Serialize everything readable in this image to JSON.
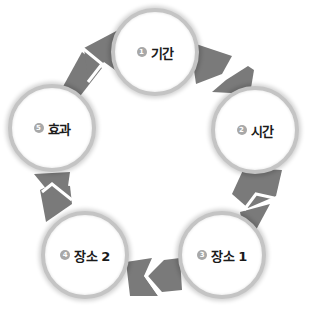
{
  "diagram": {
    "type": "cycle",
    "direction": "clockwise",
    "colors": {
      "arrow": "#7a7a7a",
      "ring": "#c4c4c4",
      "badge": "#a8a8a8",
      "node_fill": "#ffffff",
      "label": "#1a1a1a"
    },
    "nodes": [
      {
        "number": "1",
        "label": "기간"
      },
      {
        "number": "2",
        "label": "시간"
      },
      {
        "number": "3",
        "label": "장소 1"
      },
      {
        "number": "4",
        "label": "장소 2"
      },
      {
        "number": "5",
        "label": "효과"
      }
    ],
    "edges": [
      {
        "from": "1",
        "to": "2"
      },
      {
        "from": "2",
        "to": "3"
      },
      {
        "from": "3",
        "to": "4"
      },
      {
        "from": "4",
        "to": "5"
      },
      {
        "from": "5",
        "to": "1"
      }
    ]
  }
}
